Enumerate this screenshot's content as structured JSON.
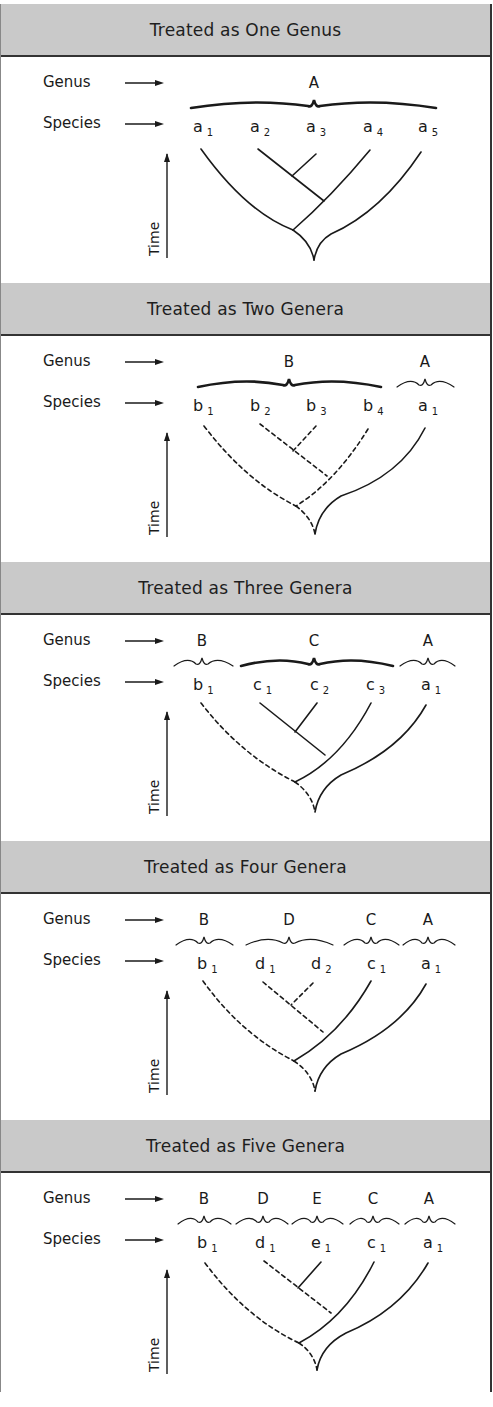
{
  "labels": {
    "genus": "Genus",
    "species": "Species",
    "time": "Time"
  },
  "panels": [
    {
      "title": "Treated as One Genus",
      "genera": [
        {
          "name": "A",
          "x": 313,
          "from": 190,
          "to": 435,
          "bold": true
        }
      ],
      "species": [
        {
          "n": "a",
          "s": "1",
          "x": 200
        },
        {
          "n": "a",
          "s": "2",
          "x": 257
        },
        {
          "n": "a",
          "s": "3",
          "x": 313
        },
        {
          "n": "a",
          "s": "4",
          "x": 370
        },
        {
          "n": "a",
          "s": "5",
          "x": 425
        }
      ],
      "branches": [
        {
          "d": "M200 147 Q245 210 292 228",
          "dash": false
        },
        {
          "d": "M257 147 L323 199",
          "dash": false
        },
        {
          "d": "M315 152 L291 174",
          "dash": false
        },
        {
          "d": "M369 148 Q330 195 292 228",
          "dash": false
        },
        {
          "d": "M292 228 Q310 240 313 258",
          "dash": false
        },
        {
          "d": "M420 150 Q380 210 330 232 Q316 240 313 258",
          "dash": false
        }
      ]
    },
    {
      "title": "Treated as Two Genera",
      "genera": [
        {
          "name": "B",
          "x": 288,
          "from": 197,
          "to": 380,
          "bold": true
        },
        {
          "name": "A",
          "x": 424,
          "from": 396,
          "to": 453,
          "bold": false
        }
      ],
      "species": [
        {
          "n": "b",
          "s": "1",
          "x": 200
        },
        {
          "n": "b",
          "s": "2",
          "x": 257
        },
        {
          "n": "b",
          "s": "3",
          "x": 313
        },
        {
          "n": "b",
          "s": "4",
          "x": 370
        },
        {
          "n": "a",
          "s": "1",
          "x": 425
        }
      ],
      "branches": [
        {
          "d": "M203 145 Q245 200 295 225",
          "dash": true
        },
        {
          "d": "M259 143 L326 195",
          "dash": true
        },
        {
          "d": "M315 145 L292 170",
          "dash": true
        },
        {
          "d": "M367 148 Q335 200 295 225",
          "dash": true
        },
        {
          "d": "M295 225 Q311 237 314 253",
          "dash": true
        },
        {
          "d": "M424 147 Q400 195 340 215 Q318 228 314 253",
          "dash": false
        }
      ]
    },
    {
      "title": "Treated as Three Genera",
      "genera": [
        {
          "name": "B",
          "x": 201,
          "from": 173,
          "to": 232,
          "bold": false
        },
        {
          "name": "C",
          "x": 313,
          "from": 240,
          "to": 392,
          "bold": true
        },
        {
          "name": "A",
          "x": 427,
          "from": 399,
          "to": 454,
          "bold": false
        }
      ],
      "species": [
        {
          "n": "b",
          "s": "1",
          "x": 200
        },
        {
          "n": "c",
          "s": "1",
          "x": 260
        },
        {
          "n": "c",
          "s": "2",
          "x": 317
        },
        {
          "n": "c",
          "s": "3",
          "x": 373
        },
        {
          "n": "a",
          "s": "1",
          "x": 428
        }
      ],
      "branches": [
        {
          "d": "M200 143 Q240 195 294 222",
          "dash": true
        },
        {
          "d": "M259 143 L324 195",
          "dash": false
        },
        {
          "d": "M316 143 L294 172",
          "dash": false
        },
        {
          "d": "M370 143 Q340 200 294 222",
          "dash": false
        },
        {
          "d": "M294 222 Q311 234 314 252",
          "dash": true
        },
        {
          "d": "M425 145 Q400 190 340 215 Q318 228 314 252",
          "dash": false
        }
      ]
    },
    {
      "title": "Treated as Four Genera",
      "genera": [
        {
          "name": "B",
          "x": 203,
          "from": 175,
          "to": 232,
          "bold": false
        },
        {
          "name": "D",
          "x": 288,
          "from": 245,
          "to": 332,
          "bold": false
        },
        {
          "name": "C",
          "x": 370,
          "from": 343,
          "to": 398,
          "bold": false
        },
        {
          "name": "A",
          "x": 427,
          "from": 402,
          "to": 454,
          "bold": false
        }
      ],
      "species": [
        {
          "n": "b",
          "s": "1",
          "x": 204
        },
        {
          "n": "d",
          "s": "1",
          "x": 262
        },
        {
          "n": "d",
          "s": "2",
          "x": 318
        },
        {
          "n": "c",
          "s": "1",
          "x": 374
        },
        {
          "n": "a",
          "s": "1",
          "x": 428
        }
      ],
      "branches": [
        {
          "d": "M202 142 Q240 195 293 222",
          "dash": true
        },
        {
          "d": "M262 143 L322 193",
          "dash": true
        },
        {
          "d": "M312 144 L290 166",
          "dash": true
        },
        {
          "d": "M370 142 Q340 195 293 222",
          "dash": false
        },
        {
          "d": "M293 222 Q311 234 314 252",
          "dash": true
        },
        {
          "d": "M425 145 Q400 190 340 215 Q318 228 314 252",
          "dash": false
        }
      ]
    },
    {
      "title": "Treated as Five Genera",
      "genera": [
        {
          "name": "B",
          "x": 203,
          "from": 177,
          "to": 230,
          "bold": false
        },
        {
          "name": "D",
          "x": 262,
          "from": 235,
          "to": 287,
          "bold": false
        },
        {
          "name": "E",
          "x": 316,
          "from": 291,
          "to": 342,
          "bold": false
        },
        {
          "name": "C",
          "x": 372,
          "from": 349,
          "to": 398,
          "bold": false
        },
        {
          "name": "A",
          "x": 428,
          "from": 404,
          "to": 454,
          "bold": false
        }
      ],
      "species": [
        {
          "n": "b",
          "s": "1",
          "x": 204
        },
        {
          "n": "d",
          "s": "1",
          "x": 262
        },
        {
          "n": "e",
          "s": "1",
          "x": 318
        },
        {
          "n": "c",
          "s": "1",
          "x": 374
        },
        {
          "n": "a",
          "s": "1",
          "x": 430
        }
      ],
      "branches": [
        {
          "d": "M204 145 Q245 200 298 225",
          "dash": true
        },
        {
          "d": "M263 143 L330 195",
          "dash": true
        },
        {
          "d": "M320 144 L297 170",
          "dash": false
        },
        {
          "d": "M373 144 Q345 200 298 225",
          "dash": false
        },
        {
          "d": "M298 225 Q313 235 316 252",
          "dash": true
        },
        {
          "d": "M427 145 Q400 192 345 215 Q320 228 316 252",
          "dash": false
        }
      ]
    }
  ]
}
